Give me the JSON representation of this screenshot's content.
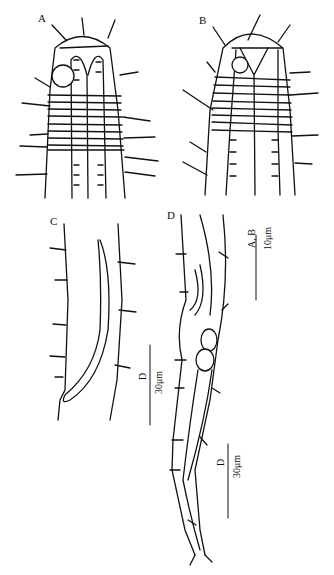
{
  "figure": {
    "panels": [
      {
        "id": "A",
        "label": "A",
        "description": "anterior end with amphid and annulated cuticle"
      },
      {
        "id": "B",
        "label": "B",
        "description": "anterior end, second view"
      },
      {
        "id": "C",
        "label": "C",
        "description": "spicule region"
      },
      {
        "id": "D",
        "label": "D",
        "description": "posterior region with tail"
      }
    ],
    "scale_bars": [
      {
        "id": "ab",
        "panels": "A, B",
        "length": "10μm"
      },
      {
        "id": "c",
        "panels": "C",
        "length": "30μm"
      },
      {
        "id": "d",
        "panels": "D",
        "length": "30μm"
      }
    ],
    "stroke_color": "#111111",
    "background": "#ffffff"
  }
}
